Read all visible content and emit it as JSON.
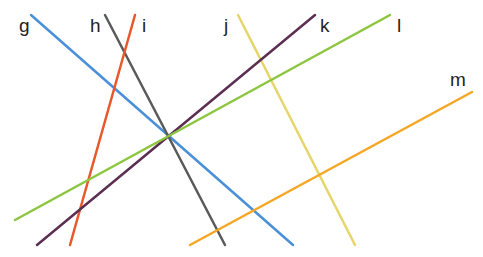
{
  "diagram": {
    "lines": [
      {
        "id": "g",
        "label": "g",
        "color": "#4a90d9",
        "x1": 31,
        "y1": 15,
        "x2": 293,
        "y2": 245,
        "lx": 19,
        "ly": 16
      },
      {
        "id": "h",
        "label": "h",
        "color": "#5a5a5a",
        "x1": 105,
        "y1": 15,
        "x2": 225,
        "y2": 245,
        "lx": 90,
        "ly": 16
      },
      {
        "id": "i",
        "label": "i",
        "color": "#e8582a",
        "x1": 135,
        "y1": 15,
        "x2": 70,
        "y2": 245,
        "lx": 142,
        "ly": 16
      },
      {
        "id": "j",
        "label": "j",
        "color": "#e6d56a",
        "x1": 238,
        "y1": 15,
        "x2": 355,
        "y2": 245,
        "lx": 224,
        "ly": 16
      },
      {
        "id": "k",
        "label": "k",
        "color": "#5b2e52",
        "x1": 315,
        "y1": 15,
        "x2": 37,
        "y2": 245,
        "lx": 320,
        "ly": 16
      },
      {
        "id": "l",
        "label": "l",
        "color": "#8cc63f",
        "x1": 390,
        "y1": 15,
        "x2": 15,
        "y2": 220,
        "lx": 397,
        "ly": 16
      },
      {
        "id": "m",
        "label": "m",
        "color": "#f5a623",
        "x1": 472,
        "y1": 92,
        "x2": 190,
        "y2": 245,
        "lx": 450,
        "ly": 70
      }
    ]
  }
}
